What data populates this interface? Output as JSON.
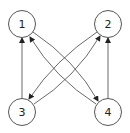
{
  "graph": {
    "type": "directed",
    "nodes": [
      {
        "id": "1",
        "label": "1",
        "x": 22,
        "y": 24
      },
      {
        "id": "2",
        "label": "2",
        "x": 108,
        "y": 24
      },
      {
        "id": "3",
        "label": "3",
        "x": 22,
        "y": 112
      },
      {
        "id": "4",
        "label": "4",
        "x": 108,
        "y": 112
      }
    ],
    "edges": [
      {
        "from": "3",
        "to": "1"
      },
      {
        "from": "4",
        "to": "2"
      },
      {
        "from": "1",
        "to": "4"
      },
      {
        "from": "4",
        "to": "1"
      },
      {
        "from": "2",
        "to": "3"
      },
      {
        "from": "3",
        "to": "2"
      }
    ],
    "colors": {
      "stroke": "#444444",
      "node_fill": "#ffffff"
    }
  }
}
